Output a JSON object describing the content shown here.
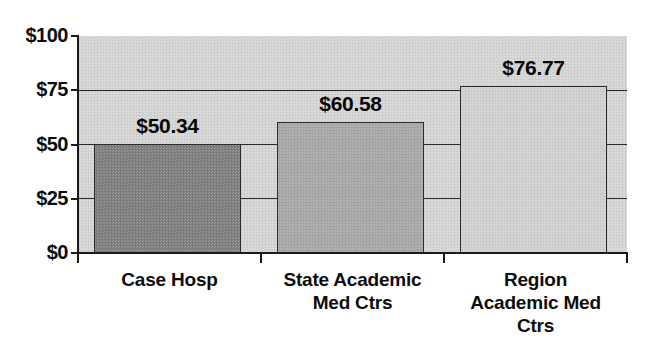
{
  "chart_data": {
    "type": "bar",
    "title": "",
    "xlabel": "",
    "ylabel": "",
    "categories": [
      "Case Hosp",
      "State Academic Med Ctrs",
      "Region Academic Med Ctrs"
    ],
    "values": [
      50.34,
      60.58,
      76.77
    ],
    "data_labels": [
      "$50.34",
      "$60.58",
      "$76.77"
    ],
    "ylim": [
      0,
      100
    ],
    "y_ticks": [
      0,
      25,
      50,
      75,
      100
    ],
    "y_tick_labels": [
      "$0",
      "$25",
      "$50",
      "$75",
      "$100"
    ],
    "grid": true,
    "grid_axis": "y",
    "legend": false,
    "bar_colors": [
      "#808080",
      "#a9a9a9",
      "#d2d2d2"
    ],
    "bar_outline_color": "#2b2b2b",
    "plot_background": "#d2d2d2",
    "page_background": "#ffffff",
    "axis_color": "#1a1a1a",
    "text_color": "#0d0d0d"
  },
  "axis": {
    "y_labels": [
      {
        "text": "$100",
        "value": 100
      },
      {
        "text": "$75",
        "value": 75
      },
      {
        "text": "$50",
        "value": 50
      },
      {
        "text": "$25",
        "value": 25
      },
      {
        "text": "$0",
        "value": 0
      }
    ]
  },
  "categories": [
    {
      "label_lines": [
        "Case Hosp"
      ],
      "value_label": "$50.34"
    },
    {
      "label_lines": [
        "State Academic",
        "Med Ctrs"
      ],
      "value_label": "$60.58"
    },
    {
      "label_lines": [
        "Region",
        "Academic Med",
        "Ctrs"
      ],
      "value_label": "$76.77"
    }
  ]
}
